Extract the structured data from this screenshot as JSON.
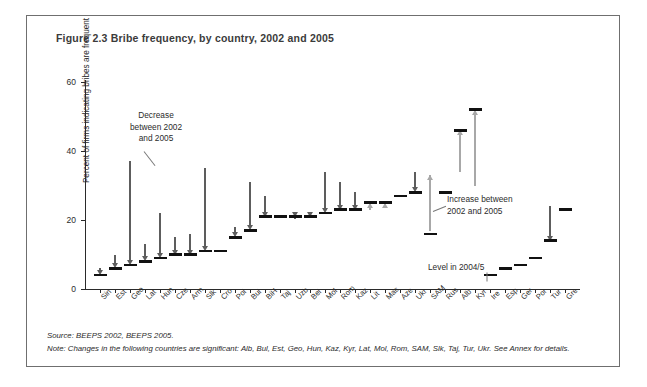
{
  "figure": {
    "title": "Figure 2.3  Bribe frequency, by country, 2002 and 2005",
    "source": "Source: BEEPS 2002, BEEPS 2005.",
    "note": "Note: Changes in the following countries are significant: Alb, Bul, Est, Geo, Hun, Kaz, Kyr, Lat, Mol, Rom, SAM, Slk, Taj, Tur, Ukr. See Annex for details."
  },
  "annotations": {
    "decrease": "Decrease\nbetween 2002\nand 2005",
    "decrease_l1": "Decrease",
    "decrease_l2": "between 2002",
    "decrease_l3": "and 2005",
    "increase_l1": "Increase between",
    "increase_l2": "2002 and 2005",
    "level": "Level in 2004/5"
  },
  "colors": {
    "decrease_arrow": "#5d5d5d",
    "increase_arrow": "#a8a8a8",
    "level_tick": "#111111",
    "axis": "#2a2a2a",
    "frame": "#6f6f6f",
    "title_text": "#3b3b3b"
  },
  "chart_data": {
    "type": "bar",
    "title": "Figure 2.3  Bribe frequency, by country, 2002 and 2005",
    "xlabel": "",
    "ylabel": "Percent of firms indicating bribes are frequent",
    "ylim": [
      0,
      60
    ],
    "yticks": [
      0,
      20,
      40,
      60
    ],
    "grid": false,
    "legend": false,
    "categories": [
      "Sin",
      "Est",
      "Geo",
      "Lat",
      "Hun",
      "Cze",
      "Arm",
      "Slk",
      "Cro",
      "Pol",
      "Bul",
      "BiH",
      "Taj",
      "Uzb",
      "Bel",
      "Mol",
      "Rom",
      "Kaz",
      "Lit",
      "Mac",
      "Aze",
      "Ukr",
      "SAM",
      "Rus",
      "Alb",
      "Kyr",
      "Ire",
      "Esp",
      "Ger",
      "Por",
      "Tur",
      "Gre"
    ],
    "series": [
      {
        "name": "2002",
        "values": [
          6,
          10,
          37,
          13,
          22,
          15,
          16,
          35,
          null,
          18,
          31,
          27,
          null,
          21,
          22,
          34,
          31,
          28,
          22,
          23,
          null,
          34,
          33,
          null,
          33,
          29,
          null,
          null,
          null,
          null,
          24,
          null
        ]
      },
      {
        "name": "2004/5",
        "values": [
          4,
          6,
          7,
          8,
          9,
          10,
          10,
          11,
          11,
          15,
          17,
          21,
          21,
          21,
          21,
          22,
          23,
          23,
          25,
          25,
          27,
          28,
          16,
          28,
          46,
          52,
          4,
          6,
          7,
          9,
          14,
          23
        ]
      }
    ],
    "direction": [
      "down",
      "down",
      "down",
      "down",
      "down",
      "down",
      "down",
      "down",
      "none",
      "down",
      "down",
      "down",
      "none",
      "down",
      "down",
      "down",
      "down",
      "down",
      "up",
      "up",
      "none",
      "down",
      "up",
      "none",
      "up",
      "up",
      "none",
      "none",
      "none",
      "none",
      "down",
      "none"
    ],
    "notes_on_marks": "Vertical arrow spans 2002 value to 2004/5 value; horizontal black tick marks the 2004/5 level. Dark gray downward arrows = decrease, light gray upward arrows = increase, bare tick = no arrow shown."
  }
}
